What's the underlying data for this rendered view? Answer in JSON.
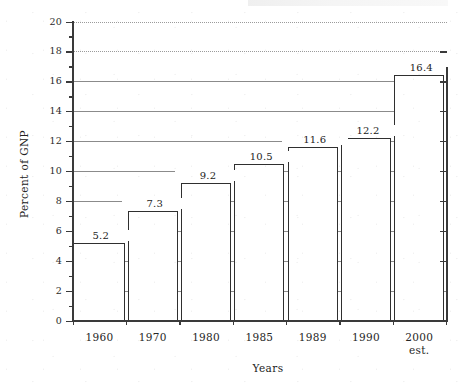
{
  "chart_data": {
    "type": "bar",
    "title": "",
    "xlabel": "Years",
    "ylabel": "Percent of GNP",
    "categories": [
      "1960",
      "1970",
      "1980",
      "1985",
      "1989",
      "1990",
      "2000"
    ],
    "category_sublabels": [
      "",
      "",
      "",
      "",
      "",
      "",
      "est."
    ],
    "values": [
      5.2,
      7.3,
      9.2,
      10.5,
      11.6,
      12.2,
      16.4
    ],
    "value_labels": [
      "5.2",
      "7.3",
      "9.2",
      "10.5",
      "11.6",
      "12.2",
      "16.4"
    ],
    "ylim": [
      0,
      20
    ],
    "ytick_step": 2,
    "ytick_labels": [
      "0",
      "2",
      "4",
      "6",
      "8",
      "10",
      "12",
      "14",
      "16",
      "18",
      "20"
    ],
    "yminor_ticks": [
      1,
      3,
      5,
      7,
      9,
      11,
      13,
      15,
      17,
      19
    ],
    "grid": "horizontal",
    "legend": "none",
    "bar_fill": "#ffffff",
    "bar_edge": "#2f2f2f",
    "grid_color": "#777777",
    "axis_color": "#3a3a3a"
  },
  "axes": {
    "y_title": "Percent of GNP",
    "x_title": "Years"
  }
}
